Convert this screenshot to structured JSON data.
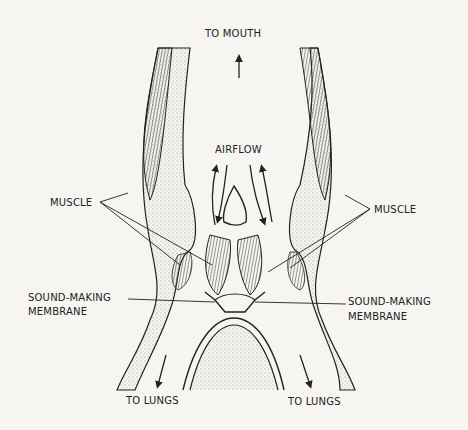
{
  "labels": {
    "to_mouth": "TO MOUTH",
    "airflow": "AIRFLOW",
    "muscle_left": "MUSCLE",
    "muscle_right": "MUSCLE",
    "membrane_left_1": "SOUND-MAKING",
    "membrane_left_2": "MEMBRANE",
    "membrane_right_1": "SOUND-MAKING",
    "membrane_right_2": "MEMBRANE",
    "lungs_left": "TO LUNGS",
    "lungs_right": "TO LUNGS"
  },
  "colors": {
    "ink": "#222222",
    "background": "#f6f5f2",
    "stipple": "#9a9a9a"
  }
}
